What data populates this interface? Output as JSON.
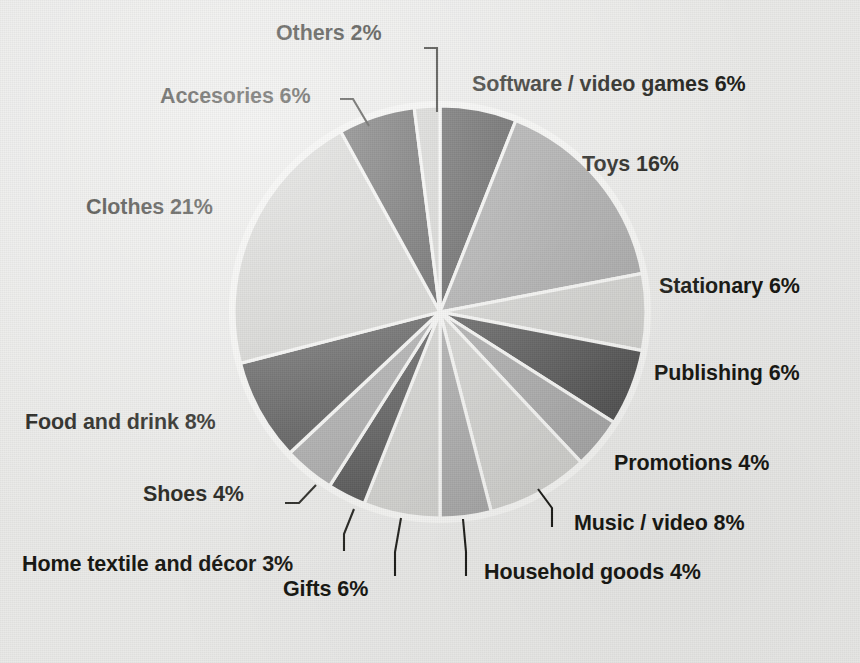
{
  "chart_data": {
    "type": "pie",
    "title": "",
    "subtitle": "",
    "xlabel": "",
    "ylabel": "",
    "legend_position": "labels-outside-with-leader-lines",
    "grid": false,
    "units": "percent",
    "total": 100,
    "start_angle_deg": 0,
    "direction": "clockwise",
    "categories": [
      "Software / video games",
      "Toys",
      "Stationary",
      "Publishing",
      "Promotions",
      "Music / video",
      "Household goods",
      "Gifts",
      "Home textile and décor",
      "Shoes",
      "Food and drink",
      "Clothes",
      "Accesories",
      "Others"
    ],
    "values": [
      6,
      16,
      6,
      6,
      4,
      8,
      4,
      6,
      3,
      4,
      8,
      21,
      6,
      2
    ],
    "labels": [
      "Software / video games 6%",
      "Toys 16%",
      "Stationary 6%",
      "Publishing 6%",
      "Promotions 4%",
      "Music / video 8%",
      "Household goods 4%",
      "Gifts 6%",
      "Home textile and décor 3%",
      "Shoes 4%",
      "Food and drink 8%",
      "Clothes 21%",
      "Accesories 6%",
      "Others 2%"
    ],
    "slice_colors": [
      "#4d4d4d",
      "#a3a3a3",
      "#cdcdca",
      "#4d4d4d",
      "#a3a3a3",
      "#cdcdca",
      "#a3a3a3",
      "#cdcdca",
      "#4d4d4d",
      "#a3a3a3",
      "#4d4d4d",
      "#cdcdca",
      "#4d4d4d",
      "#cdcdca"
    ],
    "palette": {
      "dark_gray": "#4d4d4d",
      "medium_gray": "#a3a3a3",
      "light_gray": "#cdcdca",
      "background": "#e9e9e7",
      "slice_outline": "#f4f4f2",
      "text": "#14140f"
    }
  },
  "labels": {
    "others": "Others 2%",
    "software": "Software / video games 6%",
    "accesories": "Accesories 6%",
    "toys": "Toys 16%",
    "clothes": "Clothes 21%",
    "stationary": "Stationary 6%",
    "publishing": "Publishing 6%",
    "promotions": "Promotions 4%",
    "food": "Food and drink 8%",
    "shoes": "Shoes 4%",
    "music": "Music / video 8%",
    "hometextile": "Home textile and décor 3%",
    "household": "Household goods 4%",
    "gifts": "Gifts 6%"
  }
}
